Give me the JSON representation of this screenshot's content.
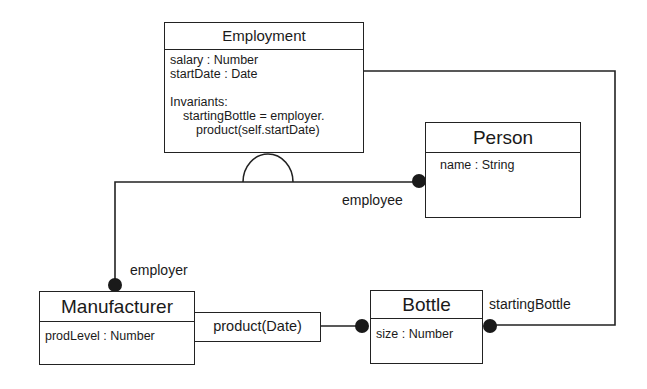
{
  "diagram": {
    "classes": {
      "employment": {
        "name": "Employment",
        "attributes": [
          "salary : Number",
          "startDate : Date"
        ],
        "invariants_title": "Invariants:",
        "invariant_line1": "startingBottle = employer.",
        "invariant_line2": "product(self.startDate)"
      },
      "person": {
        "name": "Person",
        "attributes": [
          "name : String"
        ]
      },
      "manufacturer": {
        "name": "Manufacturer",
        "attributes": [
          "prodLevel : Number"
        ]
      },
      "bottle": {
        "name": "Bottle",
        "attributes": [
          "size : Number"
        ]
      }
    },
    "qualified_operation": "product(Date)",
    "roles": {
      "employee": "employee",
      "employer": "employer",
      "startingBottle": "startingBottle"
    },
    "colors": {
      "line": "#222222",
      "background": "#ffffff"
    }
  }
}
